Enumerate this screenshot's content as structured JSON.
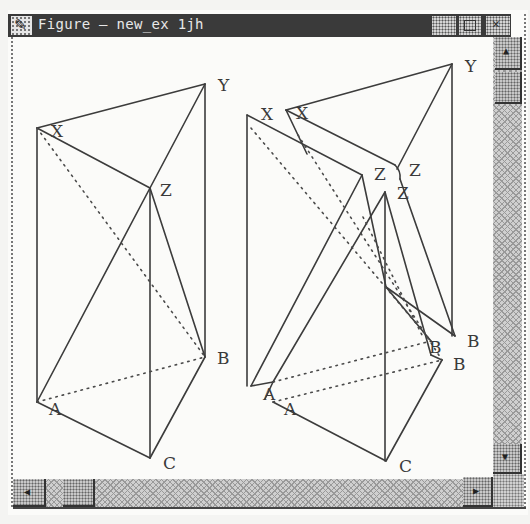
{
  "window": {
    "title": "Figure — new_ex 1jh",
    "icon": "pencil-check-icon",
    "controls": [
      "minimize-button",
      "maximize-button",
      "close-button"
    ]
  },
  "scrollbars": {
    "vertical": {
      "up_glyph": "▲",
      "down_glyph": "▼"
    },
    "horizontal": {
      "left_glyph": "◀",
      "right_glyph": "▶"
    }
  },
  "figures": [
    {
      "name": "left-prism",
      "vertices": {
        "X": {
          "label": "X",
          "x": 24,
          "y": 91,
          "lx": 38,
          "ly": 100
        },
        "Y": {
          "label": "Y",
          "x": 192,
          "y": 47,
          "lx": 205,
          "ly": 54
        },
        "Z": {
          "label": "Z",
          "x": 137,
          "y": 151,
          "lx": 147,
          "ly": 159
        },
        "A": {
          "label": "A",
          "x": 24,
          "y": 365,
          "lx": 36,
          "ly": 378
        },
        "B": {
          "label": "B",
          "x": 192,
          "y": 320,
          "lx": 204,
          "ly": 327
        },
        "C": {
          "label": "C",
          "x": 137,
          "y": 421,
          "lx": 150,
          "ly": 432
        }
      }
    },
    {
      "name": "right-prisms",
      "vertices": {
        "X1": {
          "label": "X",
          "x": 234,
          "y": 78,
          "lx": 248,
          "ly": 83
        },
        "X2": {
          "label": "X",
          "x": 273,
          "y": 73,
          "lx": 283,
          "ly": 82
        },
        "Y": {
          "label": "Y",
          "x": 439,
          "y": 27,
          "lx": 452,
          "ly": 35
        },
        "Z1": {
          "label": "Z",
          "x": 349,
          "y": 138,
          "lx": 361,
          "ly": 143
        },
        "Z2": {
          "label": "Z",
          "x": 384,
          "y": 130,
          "lx": 396,
          "ly": 139
        },
        "Z3": {
          "label": "Z",
          "x": 372,
          "y": 155,
          "lx": 384,
          "ly": 162
        },
        "A1": {
          "label": "A",
          "x": 238,
          "y": 349,
          "lx": 250,
          "ly": 363
        },
        "A2": {
          "label": "A",
          "x": 260,
          "y": 365,
          "lx": 271,
          "ly": 378
        },
        "B1": {
          "label": "B",
          "x": 442,
          "y": 299,
          "lx": 454,
          "ly": 310
        },
        "B2": {
          "label": "B",
          "x": 418,
          "y": 304,
          "lx": 416,
          "ly": 316
        },
        "B3": {
          "label": "B",
          "x": 429,
          "y": 323,
          "lx": 440,
          "ly": 333
        },
        "C": {
          "label": "C",
          "x": 373,
          "y": 424,
          "lx": 386,
          "ly": 435
        }
      }
    }
  ]
}
